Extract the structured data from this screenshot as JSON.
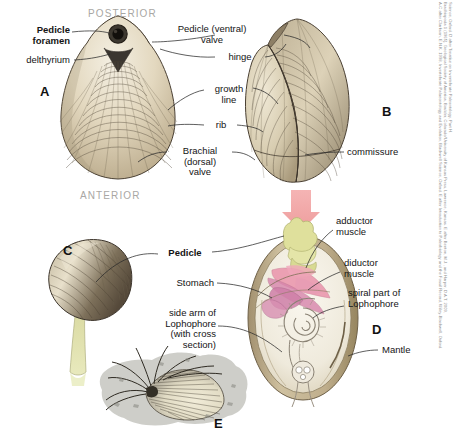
{
  "figure": {
    "orientation": {
      "posterior": "POSTERIOR",
      "anterior": "ANTERIOR"
    },
    "specimen_letters": {
      "a": "A",
      "b": "B",
      "c": "C",
      "d": "D",
      "e": "E"
    },
    "colors": {
      "shell_light": "#e6ddc8",
      "shell_mid": "#cdbf9f",
      "shell_dark": "#8c7c61",
      "shell_outline": "#4a4033",
      "arrow_pink": "#f1a8a8",
      "muscle_pink": "#e98fa8",
      "muscle_magenta": "#c77fa6",
      "pedicle_yellow": "#dede9a",
      "lophophore_cream": "#efeade",
      "rock_gray": "#c9c9c3",
      "orientation_gray": "#a9a7a4",
      "label_black": "#141414"
    }
  },
  "labels": {
    "pedicle_foramen": {
      "line1": "Pedicle",
      "line2": "foramen"
    },
    "delthyrium": "delthyrium",
    "pedicle_valve": {
      "line1_bold": "Pedicle",
      "line1_italic": "(ventral)",
      "line2": "valve"
    },
    "hinge": "hinge",
    "growth_line": {
      "line1": "growth",
      "line2": "line"
    },
    "rib": "rib",
    "brachial_valve": {
      "line1": "Brachial",
      "line2_italic": "(dorsal)",
      "line3": "valve"
    },
    "commissure": "commissure",
    "pedicle": "Pedicle",
    "adductor_muscle": {
      "line1": "adductor",
      "line2": "muscle"
    },
    "diductor_muscle": {
      "line1": "diductor",
      "line2": "muscle"
    },
    "spiral_lophophore": {
      "line1": "spiral part of",
      "line2_bold": "Lophophore"
    },
    "stomach": "Stomach",
    "side_arm_lophophore": {
      "line1": "side arm of",
      "line2_bold": "Lophophore",
      "line3_italic": "(with cross",
      "line4_italic": "section)"
    },
    "mantle": "Mantle"
  },
  "credit": {
    "line1": "Science, Oxford. D after Treatise on Invertebrate Paleontology, Part H.",
    "line2": "Brachiopoda 1 (1965), Geological Society of America, Boulder, Colorado/University of Kansas Press, Lawrence, Kansas. E after Benton, M.J., and Harper, D.A.T. 2009,",
    "line3": "A-C after Clarkson, E.N.K. 1998, Invertebrate Palaeontology and Evolution, Blackwell Science, Oxford. E after Introduction to Paleobiology and the Fossil Record, Wiley-Blackwell, Oxford."
  }
}
